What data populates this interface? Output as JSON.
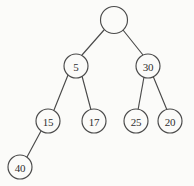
{
  "figure": {
    "background_color": "#fbfbf9",
    "stroke_color": "#4a4a4a",
    "label_color": "#2f2f2f",
    "width": 194,
    "height": 186
  },
  "chart_data": {
    "type": "diagram",
    "diagram_kind": "binary-tree",
    "title": "",
    "nodes": [
      {
        "id": "root",
        "label": "",
        "cx": 114,
        "cy": 20,
        "r": 13.5,
        "depth": 0
      },
      {
        "id": "n5",
        "label": "5",
        "cx": 76,
        "cy": 66,
        "r": 12,
        "depth": 1
      },
      {
        "id": "n30",
        "label": "30",
        "cx": 148,
        "cy": 66,
        "r": 12,
        "depth": 1
      },
      {
        "id": "n15",
        "label": "15",
        "cx": 48,
        "cy": 121,
        "r": 12,
        "depth": 2
      },
      {
        "id": "n17",
        "label": "17",
        "cx": 94,
        "cy": 121,
        "r": 12,
        "depth": 2
      },
      {
        "id": "n25",
        "label": "25",
        "cx": 136,
        "cy": 121,
        "r": 12,
        "depth": 2
      },
      {
        "id": "n20",
        "label": "20",
        "cx": 170,
        "cy": 121,
        "r": 12,
        "depth": 2
      },
      {
        "id": "n40",
        "label": "40",
        "cx": 20,
        "cy": 167,
        "r": 12,
        "depth": 3
      }
    ],
    "edges": [
      {
        "from": "root",
        "to": "n5",
        "x1": 104,
        "y1": 30,
        "x2": 82,
        "y2": 55
      },
      {
        "from": "root",
        "to": "n30",
        "x1": 123,
        "y1": 30,
        "x2": 143,
        "y2": 55
      },
      {
        "from": "n5",
        "to": "n15",
        "x1": 68,
        "y1": 75,
        "x2": 54,
        "y2": 110
      },
      {
        "from": "n5",
        "to": "n17",
        "x1": 82,
        "y1": 76,
        "x2": 91,
        "y2": 110
      },
      {
        "from": "n30",
        "to": "n25",
        "x1": 144,
        "y1": 77,
        "x2": 138,
        "y2": 110
      },
      {
        "from": "n30",
        "to": "n20",
        "x1": 153,
        "y1": 76,
        "x2": 167,
        "y2": 110
      },
      {
        "from": "n15",
        "to": "n40",
        "x1": 41,
        "y1": 131,
        "x2": 27,
        "y2": 157
      }
    ],
    "node_labels": [
      "",
      "5",
      "30",
      "15",
      "17",
      "25",
      "20",
      "40"
    ]
  }
}
